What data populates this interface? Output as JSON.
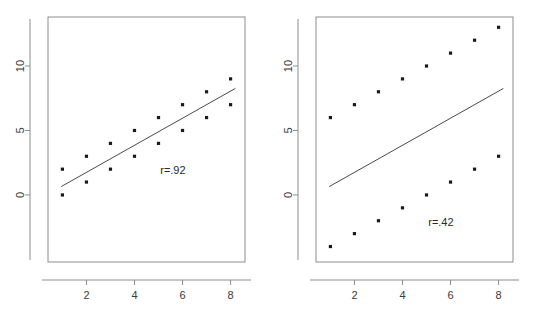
{
  "figure": {
    "background": "#ffffff",
    "point_color": "#1a1a1a",
    "line_color": "#4a4a4a",
    "axis_color": "#8d8d8d"
  },
  "chart_data": [
    {
      "type": "scatter",
      "panel": "left",
      "title": "",
      "xlabel": "",
      "ylabel": "",
      "xlim": [
        0.4,
        8.6
      ],
      "ylim": [
        -5.2,
        13.8
      ],
      "xticks": [
        2,
        4,
        6,
        8
      ],
      "xtick_labels": [
        "2",
        "4",
        "6",
        "8"
      ],
      "yticks": [
        0,
        5,
        10
      ],
      "ytick_labels": [
        "0",
        "5",
        "10"
      ],
      "ytick_label_rotation": -90,
      "grid": false,
      "legend": "none",
      "annotation": "r=.92",
      "annotation_x": 5.6,
      "annotation_y": 1.6,
      "x": [
        1,
        1,
        2,
        2,
        3,
        3,
        4,
        4,
        5,
        5,
        6,
        6,
        7,
        7,
        8,
        8
      ],
      "y": [
        2,
        0,
        3,
        1,
        4,
        2,
        5,
        3,
        6,
        4,
        7,
        5,
        8,
        6,
        9,
        7
      ],
      "fit_line": {
        "slope": 1.05,
        "intercept": -0.35,
        "x_start": 0.95,
        "x_end": 8.2
      }
    },
    {
      "type": "scatter",
      "panel": "right",
      "title": "",
      "xlabel": "",
      "ylabel": "",
      "xlim": [
        0.4,
        8.6
      ],
      "ylim": [
        -5.2,
        13.8
      ],
      "xticks": [
        2,
        4,
        6,
        8
      ],
      "xtick_labels": [
        "2",
        "4",
        "6",
        "8"
      ],
      "yticks": [
        0,
        5,
        10
      ],
      "ytick_labels": [
        "0",
        "5",
        "10"
      ],
      "ytick_label_rotation": -90,
      "grid": false,
      "legend": "none",
      "annotation": "r=.42",
      "annotation_x": 5.6,
      "annotation_y": -2.4,
      "x": [
        1,
        2,
        3,
        4,
        5,
        6,
        7,
        8,
        1,
        2,
        3,
        4,
        5,
        6,
        7,
        8
      ],
      "y": [
        6,
        7,
        8,
        9,
        10,
        11,
        12,
        13,
        -4,
        -3,
        -2,
        -1,
        0,
        1,
        2,
        3
      ],
      "series": [
        {
          "name": "upper-cluster",
          "x": [
            1,
            2,
            3,
            4,
            5,
            6,
            7,
            8
          ],
          "values": [
            6,
            7,
            8,
            9,
            10,
            11,
            12,
            13
          ]
        },
        {
          "name": "lower-cluster",
          "x": [
            1,
            2,
            3,
            4,
            5,
            6,
            7,
            8
          ],
          "values": [
            -4,
            -3,
            -2,
            -1,
            0,
            1,
            2,
            3
          ]
        }
      ],
      "fit_line": {
        "slope": 1.05,
        "intercept": -0.35,
        "x_start": 0.95,
        "x_end": 8.2
      }
    }
  ]
}
